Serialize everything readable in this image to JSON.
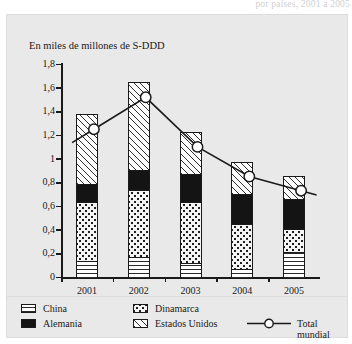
{
  "figure": {
    "top_caption_partial": "por países, 2001 a 2005",
    "unit_label": "En miles de millones de S-DDD",
    "x_axis_title": "Año"
  },
  "chart_data": {
    "type": "bar",
    "title": "En miles de millones de S-DDD",
    "xlabel": "Año",
    "ylabel": "En miles de millones de S-DDD",
    "ylim": [
      0,
      1.8
    ],
    "ytick_labels": [
      "0",
      "0,2",
      "0,4",
      "0,6",
      "0,8",
      "1",
      "1,2",
      "1,4",
      "1,6",
      "1,8"
    ],
    "ytick_values": [
      0,
      0.2,
      0.4,
      0.6,
      0.8,
      1,
      1.2,
      1.4,
      1.6,
      1.8
    ],
    "categories": [
      "2001",
      "2002",
      "2003",
      "2004",
      "2005"
    ],
    "stacked": true,
    "grid": false,
    "legend_position": "bottom",
    "series": [
      {
        "name": "China",
        "pattern": "horizontal-lines",
        "values": [
          0.15,
          0.18,
          0.13,
          0.08,
          0.22
        ]
      },
      {
        "name": "Dinamarca",
        "pattern": "dotted",
        "values": [
          0.5,
          0.57,
          0.52,
          0.38,
          0.2
        ]
      },
      {
        "name": "Alemania",
        "pattern": "solid-black",
        "values": [
          0.15,
          0.17,
          0.23,
          0.25,
          0.25
        ]
      },
      {
        "name": "Estados Unidos",
        "pattern": "diagonal-hatch",
        "values": [
          0.58,
          0.73,
          0.35,
          0.27,
          0.19
        ]
      }
    ],
    "line_series": {
      "name": "Total mundial",
      "marker": "open-circle",
      "values": [
        1.38,
        1.65,
        1.23,
        0.98,
        0.86
      ]
    }
  },
  "legend": {
    "items": [
      {
        "label": "China"
      },
      {
        "label": "Alemania"
      },
      {
        "label": "Dinamarca"
      },
      {
        "label": "Estados Unidos"
      },
      {
        "label": "Total mundial"
      }
    ]
  }
}
